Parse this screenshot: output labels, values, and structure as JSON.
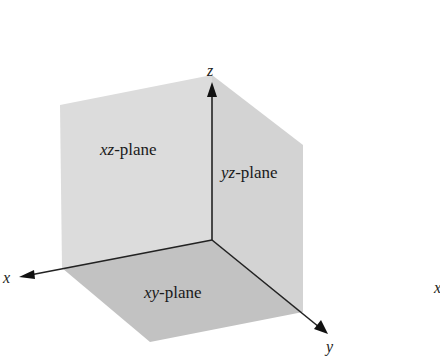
{
  "diagram": {
    "axes": {
      "x": {
        "label": "x"
      },
      "y": {
        "label": "y"
      },
      "z": {
        "label": "z"
      }
    },
    "planes": {
      "xz": {
        "var": "xz",
        "suffix": "-plane",
        "color": "#dcdcdc"
      },
      "yz": {
        "var": "yz",
        "suffix": "-plane",
        "color": "#d2d2d2"
      },
      "xy": {
        "var": "xy",
        "suffix": "-plane",
        "color": "#c4c4c4"
      }
    },
    "cropped_label": "x"
  }
}
